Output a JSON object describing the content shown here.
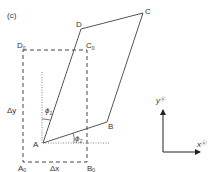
{
  "figure": {
    "panel_label": "(c)",
    "points": {
      "A": "A",
      "B": "B",
      "C": "C",
      "D": "D",
      "A0": "A",
      "B0": "B",
      "C0": "C",
      "D0": "D",
      "subscript": "0"
    },
    "labels": {
      "delta_x": "Δx",
      "delta_y": "Δy",
      "phi1": "ϕ",
      "phi1_sub": "1",
      "phi2": "ϕ",
      "phi2_sub": "2",
      "axis_x": "x",
      "axis_y": "y",
      "axis_sup": "ⓔ"
    },
    "colors": {
      "line": "#555555",
      "text": "#333333",
      "axis": "#222222"
    }
  }
}
